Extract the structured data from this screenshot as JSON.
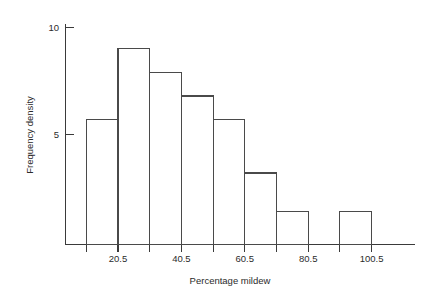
{
  "chart_data": {
    "type": "bar",
    "title": "",
    "subtitle": "",
    "xlabel": "Percentage mildew",
    "ylabel": "Frequency density",
    "grid": false,
    "legend": null,
    "legend_position": "none",
    "xlim": [
      0.5,
      110.5
    ],
    "ylim": [
      0.65,
      10.4
    ],
    "x_tick_labels": [
      "20.5",
      "40.5",
      "60.5",
      "80.5",
      "100.5"
    ],
    "x_tick_values": [
      20.5,
      40.5,
      60.5,
      80.5,
      100.5
    ],
    "y_tick_labels": [
      "5",
      "10"
    ],
    "y_tick_values": [
      5,
      10
    ],
    "bin_edges": [
      0.5,
      10.5,
      20.5,
      30.5,
      40.5,
      50.5,
      60.5,
      70.5,
      80.5,
      90.5,
      100.5,
      110.5
    ],
    "categories": [
      "0.5-10.5",
      "10.5-20.5",
      "20.5-30.5",
      "30.5-40.5",
      "40.5-50.5",
      "50.5-60.5",
      "60.5-70.5",
      "70.5-80.5",
      "80.5-90.5",
      "90.5-100.5",
      "100.5-110.5"
    ],
    "values": [
      0,
      5.7,
      9.0,
      7.9,
      6.8,
      5.7,
      3.2,
      1.4,
      0,
      1.4,
      0
    ],
    "bars": [
      {
        "label": "10.5-20.5",
        "x0": 10.5,
        "x1": 20.5,
        "value": 5.7
      },
      {
        "label": "20.5-30.5",
        "x0": 20.5,
        "x1": 30.5,
        "value": 9.0
      },
      {
        "label": "30.5-40.5",
        "x0": 30.5,
        "x1": 40.5,
        "value": 7.9
      },
      {
        "label": "40.5-50.5",
        "x0": 40.5,
        "x1": 50.5,
        "value": 6.8
      },
      {
        "label": "50.5-60.5",
        "x0": 50.5,
        "x1": 60.5,
        "value": 5.7
      },
      {
        "label": "60.5-70.5",
        "x0": 60.5,
        "x1": 70.5,
        "value": 3.2
      },
      {
        "label": "70.5-80.5",
        "x0": 70.5,
        "x1": 80.5,
        "value": 1.4
      },
      {
        "label": "90.5-100.5",
        "x0": 90.5,
        "x1": 100.5,
        "value": 1.4
      }
    ],
    "colors": {
      "bar_stroke": "#4a4a4a",
      "bar_fill": "none",
      "axis": "#3a3a3a",
      "text": "#2b2b2b",
      "background": "#ffffff"
    }
  }
}
